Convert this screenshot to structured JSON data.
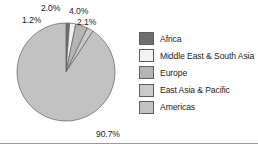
{
  "chart_data": {
    "type": "pie",
    "title": "",
    "categories": [
      "Africa",
      "Middle East & South Asia",
      "Europe",
      "East Asia & Pacific",
      "Americas"
    ],
    "values": [
      1.2,
      2.0,
      4.0,
      2.1,
      90.7
    ],
    "value_labels": [
      "1.2%",
      "2.0%",
      "4.0%",
      "2.1%",
      "90.7%"
    ],
    "colors": [
      "#6e6e6e",
      "#f2f2f2",
      "#b5b5b5",
      "#c9c9c9",
      "#c2c2c2"
    ],
    "start_angle_deg": 0,
    "direction": "clockwise",
    "legend_position": "right",
    "grid": false,
    "xlabel": "",
    "ylabel": ""
  },
  "labels": {
    "africa": "1.2%",
    "middle_east_south_asia": "2.0%",
    "europe": "4.0%",
    "east_asia_pacific": "2.1%",
    "americas": "90.7%"
  },
  "legend": {
    "items": [
      {
        "label": "Africa",
        "color": "#6e6e6e"
      },
      {
        "label": "Middle East & South Asia",
        "color": "#f2f2f2"
      },
      {
        "label": "Europe",
        "color": "#b5b5b5"
      },
      {
        "label": "East Asia & Pacific",
        "color": "#c9c9c9"
      },
      {
        "label": "Americas",
        "color": "#c2c2c2"
      }
    ]
  }
}
